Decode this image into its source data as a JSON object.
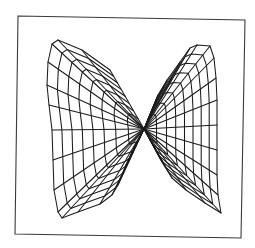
{
  "figure": {
    "frame": {
      "corners": [
        [
          18,
          16
        ],
        [
          245,
          20
        ],
        [
          241,
          238
        ],
        [
          15,
          234
        ]
      ],
      "stroke": "#3a3a3a"
    },
    "mesh": {
      "stroke": "#1c1c1c",
      "center": [
        144,
        129
      ],
      "rings": 8,
      "left_wing": {
        "outer_boundary": [
          [
            110,
            70
          ],
          [
            82,
            50
          ],
          [
            58,
            40
          ],
          [
            52,
            44
          ],
          [
            48,
            62
          ],
          [
            47,
            85
          ],
          [
            49,
            105
          ],
          [
            52,
            130
          ],
          [
            53,
            160
          ],
          [
            54,
            190
          ],
          [
            58,
            212
          ],
          [
            62,
            218
          ],
          [
            78,
            212
          ],
          [
            100,
            204
          ],
          [
            112,
            195
          ],
          [
            118,
            185
          ],
          [
            126,
            165
          ],
          [
            134,
            148
          ]
        ]
      },
      "right_wing": {
        "outer_boundary": [
          [
            150,
            115
          ],
          [
            158,
            95
          ],
          [
            167,
            80
          ],
          [
            180,
            62
          ],
          [
            190,
            48
          ],
          [
            197,
            45
          ],
          [
            210,
            46
          ],
          [
            214,
            58
          ],
          [
            216,
            78
          ],
          [
            217,
            100
          ],
          [
            217,
            125
          ],
          [
            217,
            150
          ],
          [
            217,
            175
          ],
          [
            218,
            195
          ],
          [
            221,
            213
          ],
          [
            205,
            203
          ],
          [
            186,
            190
          ],
          [
            172,
            178
          ],
          [
            162,
            162
          ],
          [
            154,
            146
          ]
        ]
      }
    }
  }
}
